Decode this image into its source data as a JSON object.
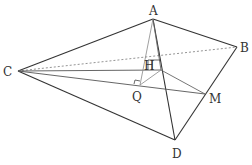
{
  "figure": {
    "colors": {
      "edge": "#333333",
      "aux": "#888888",
      "dashed": "#888888",
      "background": "#ffffff"
    },
    "points": {
      "A": {
        "x": 153,
        "y": 19
      },
      "B": {
        "x": 237,
        "y": 47
      },
      "C": {
        "x": 18,
        "y": 71
      },
      "D": {
        "x": 175,
        "y": 140
      },
      "H": {
        "x": 161,
        "y": 70
      },
      "Q": {
        "x": 140,
        "y": 85
      },
      "M": {
        "x": 205,
        "y": 94
      }
    },
    "labels": {
      "A": {
        "text": "A",
        "x": 149,
        "y": 15
      },
      "B": {
        "text": "B",
        "x": 240,
        "y": 52
      },
      "C": {
        "text": "C",
        "x": 3,
        "y": 76
      },
      "D": {
        "text": "D",
        "x": 172,
        "y": 158
      },
      "H": {
        "text": "H",
        "x": 144,
        "y": 70
      },
      "Q": {
        "text": "Q",
        "x": 132,
        "y": 101
      },
      "M": {
        "text": "M",
        "x": 209,
        "y": 103
      }
    }
  }
}
